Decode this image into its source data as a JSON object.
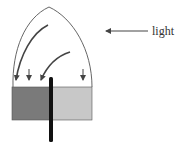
{
  "diagram": {
    "type": "phototropism-experiment",
    "labels": {
      "light": "light"
    },
    "colors": {
      "outline": "#555555",
      "arrow": "#444444",
      "dark_half": "#7a7a7a",
      "light_half": "#c8c8c8",
      "barrier": "#111111",
      "background": "#ffffff"
    },
    "elements": {
      "light_arrow": {
        "direction": "left"
      },
      "curved_arrows": 2,
      "straight_down_arrows": 2,
      "barrier": "vertical impermeable divider through block"
    }
  }
}
